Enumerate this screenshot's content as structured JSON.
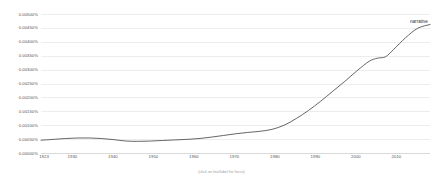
{
  "chart_data": {
    "type": "line",
    "title": "",
    "subtitle": "",
    "xlabel": "",
    "ylabel": "",
    "caption": "(click on line/label for focus)",
    "xlim": [
      1923,
      2019
    ],
    "ylim": [
      0.0,
      0.005
    ],
    "grid": true,
    "legend_position": "right-inside-top",
    "line_color": "#555555",
    "ytick_labels": [
      "0.00500%",
      "0.00450%",
      "0.00400%",
      "0.00350%",
      "0.00300%",
      "0.00250%",
      "0.00200%",
      "0.00150%",
      "0.00100%",
      "0.00050%",
      "0.00000%"
    ],
    "ytick_values": [
      0.005,
      0.0045,
      0.004,
      0.0035,
      0.003,
      0.0025,
      0.002,
      0.0015,
      0.001,
      0.0005,
      0.0
    ],
    "xtick_labels": [
      "1923",
      "1930",
      "1940",
      "1950",
      "1960",
      "1970",
      "1980",
      "1990",
      "2000",
      "2010"
    ],
    "xtick_values": [
      1923,
      1930,
      1940,
      1950,
      1960,
      1970,
      1980,
      1990,
      2000,
      2010
    ],
    "series": [
      {
        "name": "narrative",
        "color": "#555555",
        "x": [
          1923,
          1926,
          1929,
          1932,
          1935,
          1938,
          1941,
          1944,
          1947,
          1950,
          1953,
          1956,
          1959,
          1962,
          1965,
          1968,
          1971,
          1974,
          1977,
          1980,
          1983,
          1986,
          1989,
          1992,
          1995,
          1998,
          2001,
          2004,
          2006,
          2008,
          2010,
          2013,
          2016,
          2019
        ],
        "values": [
          0.00046,
          0.00049,
          0.00052,
          0.00054,
          0.00054,
          0.00052,
          0.00048,
          0.00043,
          0.00042,
          0.00043,
          0.00045,
          0.00047,
          0.00049,
          0.00052,
          0.00057,
          0.00063,
          0.00069,
          0.00074,
          0.00078,
          0.00085,
          0.001,
          0.00124,
          0.00153,
          0.00186,
          0.00222,
          0.00258,
          0.00296,
          0.0033,
          0.00341,
          0.00346,
          0.00372,
          0.00415,
          0.00449,
          0.00462
        ]
      }
    ]
  },
  "legend": {
    "label": "narrative"
  }
}
